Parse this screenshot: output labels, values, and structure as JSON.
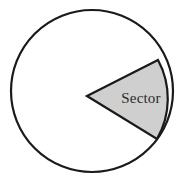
{
  "figure": {
    "background_color": "#ffffff",
    "stroke_color": "#1a1a1a"
  },
  "circle": {
    "name": "outer-circle",
    "center_x": 92,
    "center_y": 91,
    "radius": 81,
    "stroke_color": "#1a1a1a",
    "stroke_width": 2.2,
    "fill_color": "#ffffff"
  },
  "sector": {
    "label": "Sector",
    "apex_x": 87,
    "apex_y": 96,
    "start_x": 158,
    "start_y": 60,
    "end_x": 157,
    "end_y": 139,
    "start_angle_deg": -27,
    "end_angle_deg": 31,
    "sweep_deg": 58,
    "fill_color": "#cfcfcf",
    "stroke_color": "#1a1a1a",
    "stroke_width": 2.2,
    "label_x": 141,
    "label_y": 103,
    "label_color": "#2b2b2b",
    "label_font_size": 15
  },
  "geometry_path": {
    "sector_d": "M 87 96 L 158 60 A 81 81 0 0 1 157 139 Z"
  }
}
